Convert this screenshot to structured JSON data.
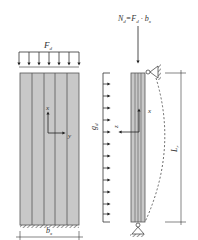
{
  "diagram": {
    "left_panel": {
      "load_label_main": "F",
      "load_label_sub": "d",
      "axis_x_label": "x",
      "axis_y_label": "y",
      "width_label_main": "b",
      "width_label_sub": "x",
      "strip_count": 5,
      "load_arrow_count": 7
    },
    "right_panel": {
      "axial_force_label": "N",
      "axial_force_sub": "d",
      "axial_force_eq": "=F",
      "axial_force_eq_sub": "d",
      "axial_force_tail": " · b",
      "axial_force_tail_sub": "x",
      "distributed_load_main": "g",
      "distributed_load_sub": "d",
      "axis_x_label": "x",
      "axis_z_label": "z",
      "length_label_main": "L",
      "length_label_sub": "r",
      "distributed_arrow_count": 13
    },
    "colors": {
      "panel_fill": "#c8c8c8",
      "strip_line": "#555555",
      "line": "#333333",
      "background": "#ffffff"
    }
  }
}
